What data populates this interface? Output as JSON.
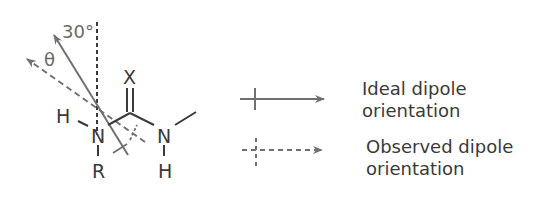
{
  "molecule": {
    "atoms": {
      "left_n": "N",
      "left_h": "H",
      "left_r": "R",
      "carbonyl_x": "X",
      "right_n": "N",
      "right_h": "H"
    },
    "angle_label": "30°",
    "theta_label": "θ"
  },
  "legend": {
    "items": [
      {
        "line1": "Ideal dipole",
        "line2": "orientation",
        "style": "solid"
      },
      {
        "line1": "Observed dipole",
        "line2": "orientation",
        "style": "dashed"
      }
    ]
  },
  "colors": {
    "bond": "#3a3a3a",
    "arrow": "#707070",
    "text": "#3a3a3a"
  }
}
